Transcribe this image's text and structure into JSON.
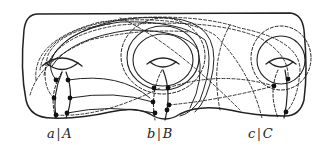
{
  "figure": {
    "type": "genus-3 surface with handle curves",
    "stroke_color": "#222222",
    "background": "#ffffff",
    "handles": [
      {
        "id": "a",
        "label_lower": "a",
        "separator": "|",
        "label_upper": "A",
        "center_x": 64
      },
      {
        "id": "b",
        "label_lower": "b",
        "separator": "|",
        "label_upper": "B",
        "center_x": 163
      },
      {
        "id": "c",
        "label_lower": "c",
        "separator": "|",
        "label_upper": "C",
        "center_x": 262
      }
    ],
    "intersection_points": [
      [
        56,
        80
      ],
      [
        68,
        80
      ],
      [
        54,
        98
      ],
      [
        70,
        98
      ],
      [
        56,
        115
      ],
      [
        67,
        113
      ],
      [
        154,
        98
      ],
      [
        168,
        88
      ],
      [
        153,
        102
      ],
      [
        169,
        105
      ],
      [
        155,
        113
      ],
      [
        167,
        110
      ],
      [
        274,
        86
      ],
      [
        288,
        79
      ],
      [
        286,
        112
      ]
    ],
    "curve_styles": [
      "solid",
      "dashed"
    ]
  }
}
